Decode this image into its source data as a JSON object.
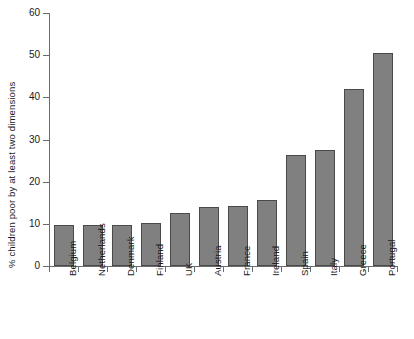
{
  "chart_data": {
    "type": "bar",
    "title": "",
    "subtitle": "",
    "xlabel": "",
    "ylabel": "% children poor by at least two dimensions",
    "categories": [
      "Belgium",
      "Netherlands",
      "Denmark",
      "Finland",
      "UK",
      "Austria",
      "France",
      "Ireland",
      "Spain",
      "Italy",
      "Greece",
      "Portugal"
    ],
    "values": [
      9.7,
      9.7,
      9.8,
      10.2,
      12.5,
      13.9,
      14.3,
      15.6,
      26.3,
      27.5,
      41.9,
      50.6
    ],
    "ylim": [
      0,
      60
    ],
    "yticks": [
      0,
      10,
      20,
      30,
      40,
      50,
      60
    ],
    "ytick_labels": [
      "0",
      "10",
      "20",
      "30",
      "40",
      "50",
      "60"
    ],
    "grid": false,
    "legend": false,
    "legend_position": "none",
    "bar_color": "#808080",
    "bar_edge_color": "#4a4a4a",
    "axis_color": "#6b6b6b",
    "background_color": "#ffffff",
    "x_tick_label_rotation": -90
  }
}
